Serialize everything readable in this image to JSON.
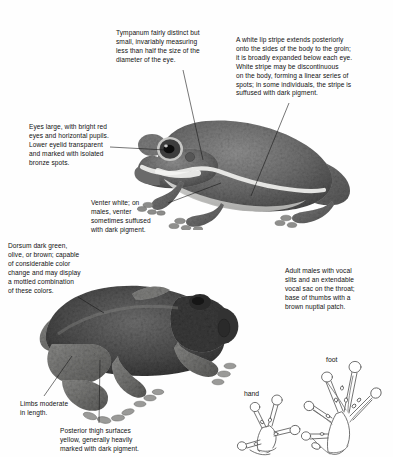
{
  "page": {
    "background_color": "#fefefe",
    "text_color": "#111111",
    "line_color": "#1a1a1a"
  },
  "callouts": {
    "tympanum": "Tympanum fairly distinct but\nsmall, invariably measuring\nless than half the size of the\ndiameter of the eye.",
    "lip_stripe": "A white lip stripe extends posteriorly\nonto the sides of the body to the groin;\nit is broadly expanded below each eye.\nWhite stripe may be discontinuous\non the body, forming a linear series of\nspots; in some individuals, the stripe is\nsuffused with dark pigment.",
    "eyes": "Eyes large, with bright red\neyes and horizontal pupils.\nLower eyelid transparent\nand marked with isolated\nbronze spots.",
    "venter": "Venter white; on\nmales, venter\nsometimes suffused\nwith dark pigment.",
    "dorsum": "Dorsum dark green,\nolive, or brown; capable\nof considerable color\nchange and may display\na mottled combination\nof these colors.",
    "vocal": "Adult males with vocal\nslits and an extendable\nvocal sac on the throat;\nbase of thumbs with a\nbrown nuptial patch.",
    "limbs": "Limbs moderate\nin length.",
    "thigh": "Posterior thigh surfaces\nyellow, generally heavily\nmarked with dark pigment."
  },
  "figure_labels": {
    "hand": "hand",
    "foot": "foot"
  },
  "figures": {
    "frog_lateral": "grayscale photograph of treefrog in lateral view facing left",
    "frog_dorsolateral": "grayscale photograph of treefrog in dorsolateral view facing right",
    "hand_drawing": "line drawing of frog hand showing four digits with expanded discs and basal webbing",
    "foot_drawing": "line drawing of frog foot showing five toes with expanded discs and extensive webbing"
  }
}
